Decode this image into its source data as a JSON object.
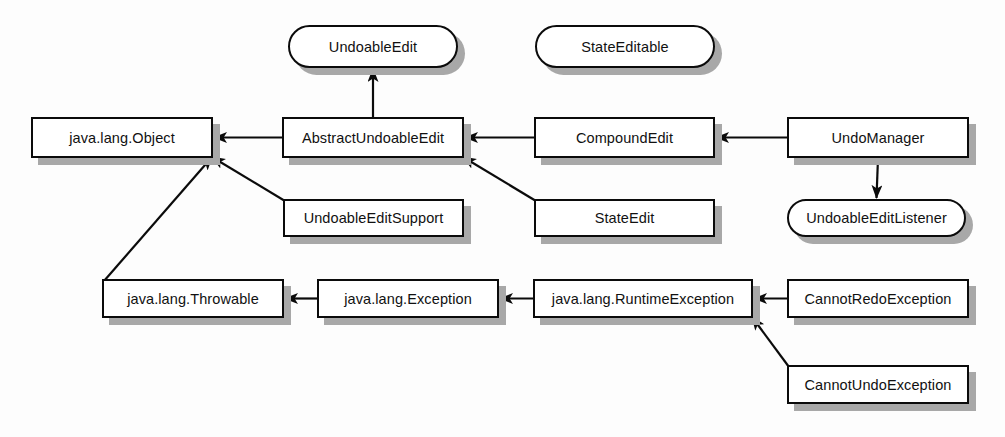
{
  "diagram": {
    "type": "uml-class-hierarchy",
    "colors": {
      "background": "#fdfdfd",
      "node_fill": "#ffffff",
      "node_stroke": "#0b0b0b",
      "shadow": "#a8a8a8",
      "text": "#111111",
      "edge": "#0b0b0b"
    },
    "legend": {
      "rounded_shape_meaning": "interface",
      "rectangle_shape_meaning": "class",
      "solid_arrow_meaning": "inheritance / implements",
      "arrowhead_style": "filled-triangle"
    },
    "nodes": [
      {
        "id": "undoableEdit",
        "label": "UndoableEdit",
        "shape": "rounded",
        "kind": "interface",
        "x": 288,
        "y": 25,
        "w": 170,
        "h": 43
      },
      {
        "id": "stateEditable",
        "label": "StateEditable",
        "shape": "rounded",
        "kind": "interface",
        "x": 535,
        "y": 25,
        "w": 180,
        "h": 43
      },
      {
        "id": "object",
        "label": "java.lang.Object",
        "shape": "rectangle",
        "kind": "class",
        "x": 31,
        "y": 117,
        "w": 182,
        "h": 41
      },
      {
        "id": "abstractUndoableEdit",
        "label": "AbstractUndoableEdit",
        "shape": "rectangle",
        "kind": "class",
        "x": 282,
        "y": 117,
        "w": 182,
        "h": 41
      },
      {
        "id": "compoundEdit",
        "label": "CompoundEdit",
        "shape": "rectangle",
        "kind": "class",
        "x": 534,
        "y": 117,
        "w": 181,
        "h": 41
      },
      {
        "id": "undoManager",
        "label": "UndoManager",
        "shape": "rectangle",
        "kind": "class",
        "x": 787,
        "y": 117,
        "w": 182,
        "h": 41
      },
      {
        "id": "undoableEditSupport",
        "label": "UndoableEditSupport",
        "shape": "rectangle",
        "kind": "class",
        "x": 283,
        "y": 199,
        "w": 181,
        "h": 38
      },
      {
        "id": "stateEdit",
        "label": "StateEdit",
        "shape": "rectangle",
        "kind": "class",
        "x": 534,
        "y": 199,
        "w": 181,
        "h": 38
      },
      {
        "id": "undoableEditListener",
        "label": "UndoableEditListener",
        "shape": "rounded",
        "kind": "interface",
        "x": 787,
        "y": 199,
        "w": 179,
        "h": 38
      },
      {
        "id": "throwable",
        "label": "java.lang.Throwable",
        "shape": "rectangle",
        "kind": "class",
        "x": 102,
        "y": 279,
        "w": 182,
        "h": 39
      },
      {
        "id": "exception",
        "label": "java.lang.Exception",
        "shape": "rectangle",
        "kind": "class",
        "x": 317,
        "y": 279,
        "w": 182,
        "h": 39
      },
      {
        "id": "runtimeException",
        "label": "java.lang.RuntimeException",
        "shape": "rectangle",
        "kind": "class",
        "x": 533,
        "y": 279,
        "w": 220,
        "h": 39
      },
      {
        "id": "cannotRedoException",
        "label": "CannotRedoException",
        "shape": "rectangle",
        "kind": "class",
        "x": 787,
        "y": 279,
        "w": 182,
        "h": 39
      },
      {
        "id": "cannotUndoException",
        "label": "CannotUndoException",
        "shape": "rectangle",
        "kind": "class",
        "x": 787,
        "y": 365,
        "w": 182,
        "h": 39
      }
    ],
    "edges": [
      {
        "from": "abstractUndoableEdit",
        "to": "undoableEdit",
        "relation": "implements",
        "style": "vertical"
      },
      {
        "from": "abstractUndoableEdit",
        "to": "object",
        "relation": "extends",
        "style": "horizontal"
      },
      {
        "from": "compoundEdit",
        "to": "abstractUndoableEdit",
        "relation": "extends",
        "style": "horizontal"
      },
      {
        "from": "undoManager",
        "to": "compoundEdit",
        "relation": "extends",
        "style": "horizontal"
      },
      {
        "from": "undoManager",
        "to": "undoableEditListener",
        "relation": "implements",
        "style": "vertical"
      },
      {
        "from": "undoableEditSupport",
        "to": "object",
        "relation": "extends",
        "style": "diagonal"
      },
      {
        "from": "stateEdit",
        "to": "abstractUndoableEdit",
        "relation": "extends",
        "style": "diagonal"
      },
      {
        "from": "throwable",
        "to": "object",
        "relation": "extends",
        "style": "diagonal"
      },
      {
        "from": "exception",
        "to": "throwable",
        "relation": "extends",
        "style": "horizontal"
      },
      {
        "from": "runtimeException",
        "to": "exception",
        "relation": "extends",
        "style": "horizontal"
      },
      {
        "from": "cannotRedoException",
        "to": "runtimeException",
        "relation": "extends",
        "style": "horizontal"
      },
      {
        "from": "cannotUndoException",
        "to": "runtimeException",
        "relation": "extends",
        "style": "diagonal"
      }
    ]
  }
}
